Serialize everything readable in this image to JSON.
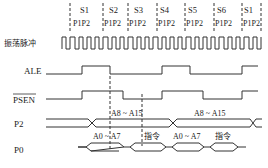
{
  "diagram": {
    "colors": {
      "line": "#333333",
      "text": "#222222",
      "background": "#ffffff"
    },
    "states": [
      {
        "label": "S1",
        "phases": "P1P2"
      },
      {
        "label": "S2",
        "phases": "P1P2"
      },
      {
        "label": "S3",
        "phases": "P1P2"
      },
      {
        "label": "S4",
        "phases": "P1P2"
      },
      {
        "label": "S5",
        "phases": "P1P2"
      },
      {
        "label": "S6",
        "phases": "P1P2"
      },
      {
        "label": "S1",
        "phases": "P1P2"
      }
    ],
    "signals": {
      "clock": "振荡脉冲",
      "ale": "ALE",
      "psen": "PSEN",
      "p2": "P2",
      "p0": "P0"
    },
    "p2_labels": [
      "A8 ~ A15",
      "A8 ~ A15"
    ],
    "p0_labels": [
      "A0 ~ A7",
      "指令",
      "A0 ~ A7",
      "指令"
    ]
  }
}
